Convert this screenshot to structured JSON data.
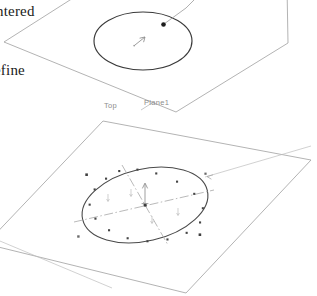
{
  "canvas": {
    "width": 317,
    "height": 296,
    "background": "#ffffff"
  },
  "annotations": {
    "centered_text": "ntered",
    "define_text": "efine"
  },
  "planes": [
    {
      "id": "upper-plane",
      "label": "",
      "sketch": "circle",
      "selected": false
    },
    {
      "id": "lower-plane",
      "label_left": "Top",
      "label_right": "Plane1",
      "sketch": "ellipse",
      "selected": true
    }
  ],
  "labels": {
    "top": "Top",
    "plane1": "Plane1"
  },
  "colors": {
    "plane_edge": "#9a9a9a",
    "sketch_dark": "#3a3a3a",
    "sketch_mid": "#5c5c5c",
    "centerline": "#a7a7a7",
    "dimension": "#b4b4b4",
    "handle": "#4a4a4a",
    "text_dark": "#1a1a1a",
    "text_grey": "#8d8d8d",
    "background": "#ffffff"
  },
  "icons": {
    "leader_arrow": "leader-arrow-icon",
    "cursor": "cursor-arrow-icon",
    "control_point": "control-point-handle",
    "dimension_arrow": "dimension-arrow-icon"
  }
}
